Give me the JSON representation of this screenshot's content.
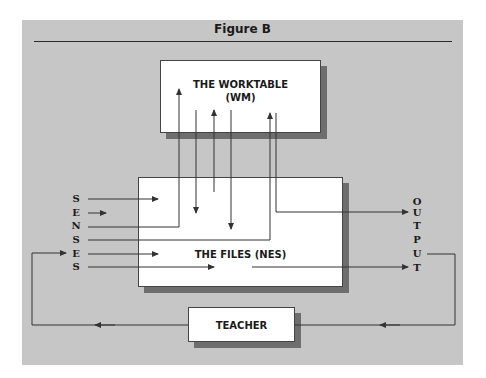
{
  "figure": {
    "title": "Figure B",
    "colors": {
      "panel": "#c6c6c6",
      "box": "#ffffff",
      "shadow": "#6e6e6e",
      "line": "#333333"
    }
  },
  "diagram": {
    "nodes": {
      "worktable": {
        "line1": "THE WORKTABLE",
        "line2": "(WM)"
      },
      "files": {
        "label": "THE FILES (NES)"
      },
      "teacher": {
        "label": "TEACHER"
      }
    },
    "input_label": {
      "word": "SENSES",
      "letters": [
        "S",
        "E",
        "N",
        "S",
        "E",
        "S"
      ]
    },
    "output_label": {
      "word": "OUTPUT",
      "letters": [
        "O",
        "U",
        "T",
        "P",
        "U",
        "T"
      ]
    },
    "edges": [
      {
        "from": "senses",
        "to": "files",
        "desc": "S arrow into files"
      },
      {
        "from": "senses",
        "to": "files",
        "desc": "E short arrow"
      },
      {
        "from": "senses",
        "to": "worktable",
        "desc": "N routed up into worktable"
      },
      {
        "from": "senses",
        "to": "worktable",
        "desc": "S routed up into worktable"
      },
      {
        "from": "senses",
        "to": "files",
        "desc": "E arrow into files"
      },
      {
        "from": "senses",
        "to": "output",
        "desc": "S passes through files to output T"
      },
      {
        "from": "worktable",
        "to": "files",
        "desc": "down arrows into files"
      },
      {
        "from": "files",
        "to": "worktable",
        "desc": "up arrow into worktable"
      },
      {
        "from": "worktable",
        "to": "output",
        "desc": "routed down and right to output U"
      },
      {
        "from": "output",
        "to": "teacher",
        "desc": "feedback loop to teacher"
      },
      {
        "from": "teacher",
        "to": "senses",
        "desc": "feedback loop to senses E"
      }
    ]
  }
}
